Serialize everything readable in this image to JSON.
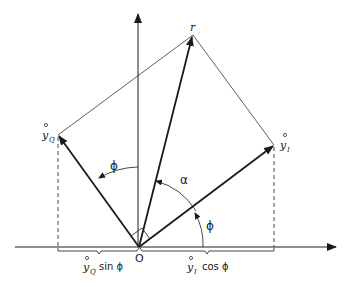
{
  "diagram": {
    "labels": {
      "r": "r",
      "yQ": "y",
      "yQ_sub": "Q",
      "yI": "y",
      "yI_sub": "I",
      "origin": "O",
      "phi_upper": "ϕ",
      "alpha": "α",
      "phi_lower": "ϕ",
      "left_brace_y": "y",
      "left_brace_sub": "Q",
      "left_brace_fn": "sin ϕ",
      "right_brace_y": "y",
      "right_brace_sub": "I",
      "right_brace_fn": "cos ϕ"
    },
    "colors": {
      "ink": "#1a1a1a",
      "background": "#ffffff"
    },
    "points": {
      "origin": [
        139,
        247
      ],
      "r_tip": [
        193,
        35
      ],
      "yQ_tip": [
        58,
        135
      ],
      "yI_tip": [
        274,
        145
      ]
    }
  }
}
